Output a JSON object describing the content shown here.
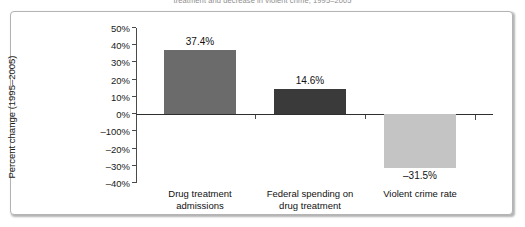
{
  "figure": {
    "caption": "treatment and decrease in violent crime, 1995–2005"
  },
  "chart_data": {
    "type": "bar",
    "title": "",
    "xlabel": "",
    "ylabel": "Percent change (1995–2005)",
    "categories": [
      "Drug treatment admissions",
      "Federal spending on drug treatment",
      "Violent crime rate"
    ],
    "category_lines": [
      [
        "Drug treatment",
        "admissions"
      ],
      [
        "Federal spending on",
        "drug treatment"
      ],
      [
        "Violent crime rate",
        ""
      ]
    ],
    "values": [
      37.4,
      14.6,
      -31.5
    ],
    "value_labels": [
      "37.4%",
      "14.6%",
      "–31.5%"
    ],
    "bar_colors": [
      "#6b6b6b",
      "#3a3a3a",
      "#c4c4c4"
    ],
    "ylim": [
      -40,
      50
    ],
    "ytick_values": [
      50,
      40,
      30,
      20,
      10,
      0,
      -10,
      -20,
      -30,
      -40
    ],
    "ytick_labels": [
      "50%",
      "40%",
      "30%",
      "20%",
      "10%",
      "0%",
      "–100%",
      "–20%",
      "–30%",
      "–40%"
    ],
    "grid": false,
    "legend": "none"
  },
  "style": {
    "frame_border_color": "#b4b4b4",
    "axis_color": "#4a4a4a",
    "zero_line_color": "#2e2e2e",
    "text_color": "#111111",
    "background": "#ffffff"
  }
}
